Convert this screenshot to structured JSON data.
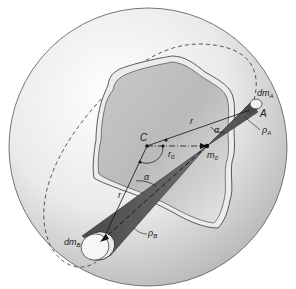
{
  "figure": {
    "colors": {
      "sphere_fill_light": "#f4f4f4",
      "sphere_fill_dark": "#bdbdbd",
      "sphere_outline": "#555555",
      "body_fill": "#b8b8b8",
      "body_rim": "#ededed",
      "cone_fill": "#5a5a5a",
      "line": "#1a1a1a"
    }
  },
  "labels": {
    "dmA": {
      "main": "dm",
      "sub": "A"
    },
    "A": "A",
    "rhoA": {
      "main": "ρ",
      "sub": "A"
    },
    "r_upper": "r",
    "alpha_upper": "α",
    "C": "C",
    "r0": {
      "main": "r",
      "sub": "0"
    },
    "m0": {
      "main": "m",
      "sub": "0"
    },
    "alpha_lower": "α",
    "r_lower": "r",
    "rhoB": {
      "main": "ρ",
      "sub": "B"
    },
    "dmB": {
      "main": "dm",
      "sub": "B"
    }
  }
}
